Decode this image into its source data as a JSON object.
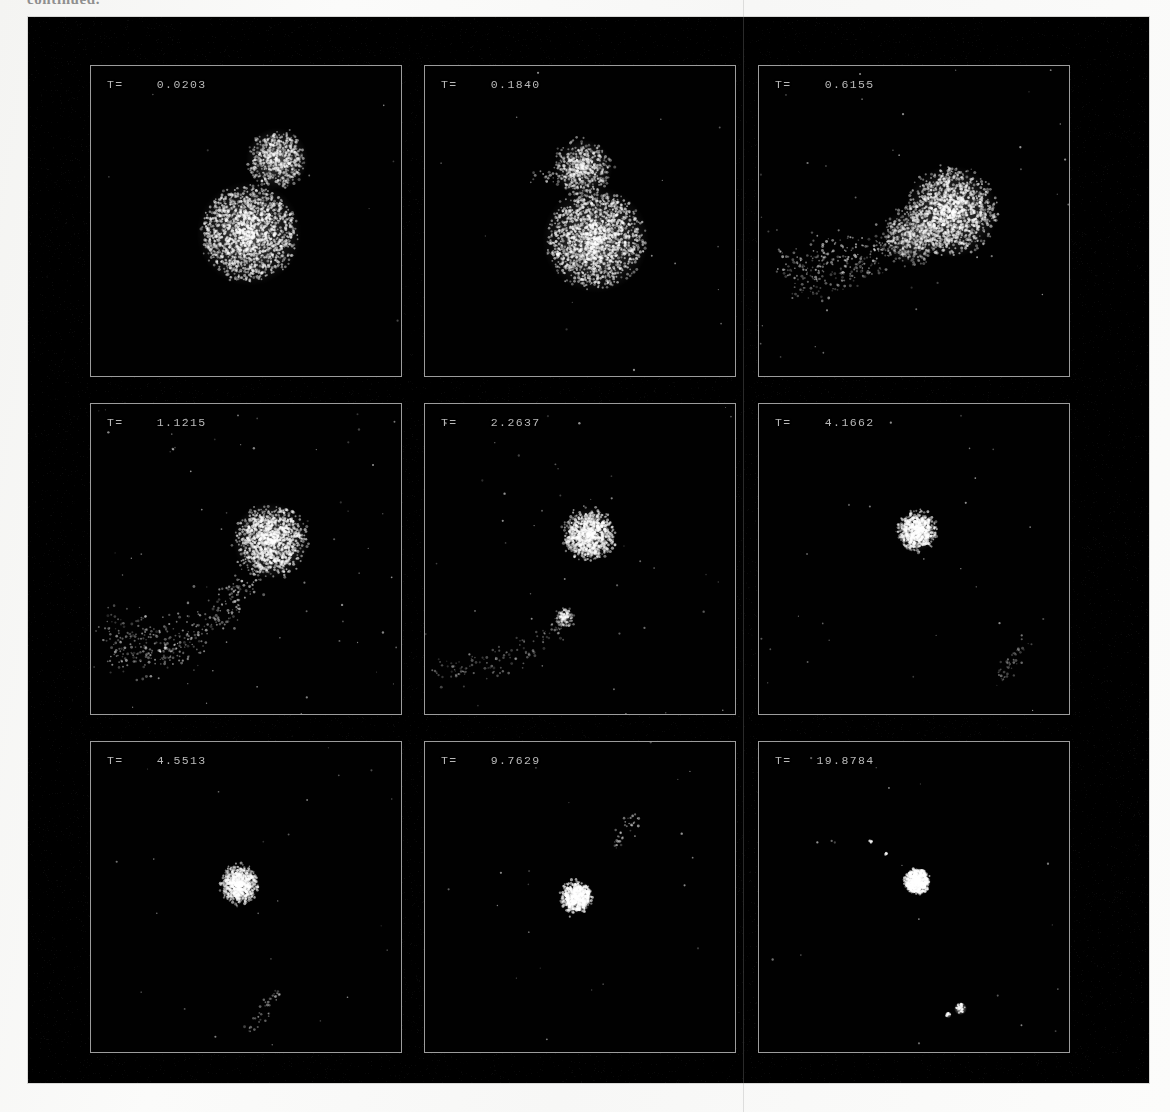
{
  "figure": {
    "caption_top": "continued.",
    "plate_background": "#000000",
    "panel_border_color": "#9c9c9c",
    "label_color": "#b9b9b9",
    "particle_color": "#ffffff",
    "rows": 3,
    "columns": 3
  },
  "chart_data": {
    "type": "scatter",
    "title": "continued.",
    "xlabel": "",
    "ylabel": "",
    "grid": false,
    "legend": null,
    "axis_ranges": {
      "x": [
        -1,
        1
      ],
      "y": [
        -1,
        1
      ]
    },
    "panels": [
      {
        "index": 1,
        "label": "T=    0.0203",
        "time": 0.0203,
        "clumps": [
          {
            "name": "primary",
            "cx": 0.02,
            "cy": 0.08,
            "r": 0.295,
            "n": 1500,
            "core": 0.42,
            "brightness": 0.8,
            "rough": 0.1
          },
          {
            "name": "secondary",
            "cx": 0.2,
            "cy": -0.4,
            "r": 0.175,
            "n": 520,
            "core": 0.4,
            "brightness": 0.74,
            "rough": 0.16
          }
        ],
        "streams": [],
        "debris": 10
      },
      {
        "index": 2,
        "label": "T=    0.1840",
        "time": 0.184,
        "clumps": [
          {
            "name": "primary",
            "cx": 0.1,
            "cy": 0.12,
            "r": 0.3,
            "n": 1500,
            "core": 0.4,
            "brightness": 0.82,
            "rough": 0.12
          },
          {
            "name": "secondary",
            "cx": 0.02,
            "cy": -0.34,
            "r": 0.165,
            "n": 470,
            "core": 0.34,
            "brightness": 0.7,
            "rough": 0.26
          }
        ],
        "streams": [
          {
            "x0": -0.3,
            "y0": -0.28,
            "x1": 0.0,
            "y1": -0.3,
            "n": 45,
            "spread": 0.035,
            "brightness": 0.55
          }
        ],
        "debris": 16
      },
      {
        "index": 3,
        "label": "T=    0.6155",
        "time": 0.6155,
        "clumps": [
          {
            "name": "primary",
            "cx": 0.24,
            "cy": -0.06,
            "r": 0.26,
            "n": 1250,
            "core": 0.38,
            "brightness": 0.8,
            "rough": 0.18
          },
          {
            "name": "secondary",
            "cx": -0.02,
            "cy": 0.1,
            "r": 0.16,
            "n": 420,
            "core": 0.3,
            "brightness": 0.62,
            "rough": 0.32
          }
        ],
        "streams": [
          {
            "x0": -0.86,
            "y0": 0.3,
            "x1": -0.05,
            "y1": 0.14,
            "n": 230,
            "spread": 0.075,
            "brightness": 0.58
          },
          {
            "x0": -0.78,
            "y0": 0.46,
            "x1": -0.2,
            "y1": 0.28,
            "n": 110,
            "spread": 0.055,
            "brightness": 0.44
          }
        ],
        "debris": 40
      },
      {
        "index": 4,
        "label": "T=    1.1215",
        "time": 1.1215,
        "clumps": [
          {
            "name": "primary",
            "cx": 0.16,
            "cy": -0.12,
            "r": 0.215,
            "n": 1050,
            "core": 0.36,
            "brightness": 0.84,
            "rough": 0.22
          }
        ],
        "streams": [
          {
            "x0": -0.88,
            "y0": 0.62,
            "x1": 0.06,
            "y1": 0.05,
            "n": 300,
            "spread": 0.085,
            "brightness": 0.55,
            "curve": 0.34
          },
          {
            "x0": -0.94,
            "y0": 0.4,
            "x1": -0.35,
            "y1": 0.62,
            "n": 120,
            "spread": 0.085,
            "brightness": 0.4
          }
        ],
        "debris": 60
      },
      {
        "index": 5,
        "label": "T=    2.2637",
        "time": 2.2637,
        "clumps": [
          {
            "name": "primary",
            "cx": 0.06,
            "cy": -0.16,
            "r": 0.15,
            "n": 820,
            "core": 0.34,
            "brightness": 0.86,
            "rough": 0.26
          },
          {
            "name": "fragment",
            "cx": -0.1,
            "cy": 0.38,
            "r": 0.055,
            "n": 90,
            "core": 0.4,
            "brightness": 0.72,
            "rough": 0.3
          }
        ],
        "streams": [
          {
            "x0": -0.92,
            "y0": 0.72,
            "x1": -0.1,
            "y1": 0.4,
            "n": 130,
            "spread": 0.055,
            "brightness": 0.42,
            "curve": 0.18
          }
        ],
        "debris": 45
      },
      {
        "index": 6,
        "label": "T=    4.1662",
        "time": 4.1662,
        "clumps": [
          {
            "name": "primary",
            "cx": 0.02,
            "cy": -0.18,
            "r": 0.115,
            "n": 650,
            "core": 0.34,
            "brightness": 0.9,
            "rough": 0.28
          }
        ],
        "streams": [
          {
            "x0": 0.55,
            "y0": 0.78,
            "x1": 0.72,
            "y1": 0.52,
            "n": 45,
            "spread": 0.03,
            "brightness": 0.42
          }
        ],
        "debris": 28
      },
      {
        "index": 7,
        "label": "T=    4.5513",
        "time": 4.5513,
        "clumps": [
          {
            "name": "primary",
            "cx": -0.04,
            "cy": -0.08,
            "r": 0.11,
            "n": 640,
            "core": 0.34,
            "brightness": 0.9,
            "rough": 0.28
          }
        ],
        "streams": [
          {
            "x0": 0.02,
            "y0": 0.86,
            "x1": 0.22,
            "y1": 0.62,
            "n": 40,
            "spread": 0.028,
            "brightness": 0.45
          }
        ],
        "debris": 26
      },
      {
        "index": 8,
        "label": "T=    9.7629",
        "time": 9.7629,
        "clumps": [
          {
            "name": "primary",
            "cx": -0.02,
            "cy": 0.0,
            "r": 0.095,
            "n": 600,
            "core": 0.36,
            "brightness": 0.93,
            "rough": 0.24
          }
        ],
        "streams": [
          {
            "x0": 0.22,
            "y0": -0.32,
            "x1": 0.36,
            "y1": -0.52,
            "n": 35,
            "spread": 0.026,
            "brightness": 0.58
          }
        ],
        "debris": 22
      },
      {
        "index": 9,
        "label": "T=   19.8784",
        "time": 19.8784,
        "clumps": [
          {
            "name": "primary",
            "cx": 0.02,
            "cy": -0.1,
            "r": 0.078,
            "n": 540,
            "core": 0.55,
            "brightness": 1.0,
            "rough": 0.14
          }
        ],
        "streams": [],
        "debris": 18,
        "blobs": [
          {
            "cx": 0.3,
            "cy": 0.72,
            "r": 0.03,
            "n": 26,
            "brightness": 0.92
          },
          {
            "cx": 0.22,
            "cy": 0.76,
            "r": 0.016,
            "n": 10,
            "brightness": 0.88
          },
          {
            "cx": -0.28,
            "cy": -0.36,
            "r": 0.01,
            "n": 6,
            "brightness": 0.8
          },
          {
            "cx": -0.18,
            "cy": -0.28,
            "r": 0.008,
            "n": 5,
            "brightness": 0.76
          }
        ]
      }
    ]
  }
}
